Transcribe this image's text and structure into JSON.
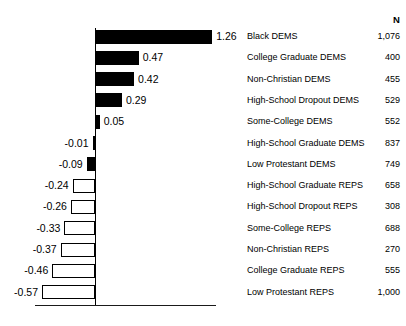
{
  "title_fragment": "",
  "columns": {
    "n_header": "N"
  },
  "axis": {
    "zero_value": 0,
    "unit_px": 93,
    "zero_x_px": 95
  },
  "chart_data": {
    "type": "bar",
    "orientation": "horizontal",
    "title": "",
    "subtitle": "",
    "xlabel": "",
    "ylabel": "",
    "grid": false,
    "legend": "none",
    "xlim": [
      -0.63,
      1.32
    ],
    "zero_line": true,
    "categories": [
      "Black DEMS",
      "College Graduate DEMS",
      "Non-Christian DEMS",
      "High-School Dropout DEMS",
      "Some-College DEMS",
      "High-School Graduate DEMS",
      "Low Protestant DEMS",
      "High-School Graduate REPS",
      "High-School Dropout REPS",
      "Some-College REPS",
      "Non-Christian REPS",
      "College Graduate REPS",
      "Low Protestant REPS"
    ],
    "values": [
      1.26,
      0.47,
      0.42,
      0.29,
      0.05,
      -0.01,
      -0.09,
      -0.24,
      -0.26,
      -0.33,
      -0.37,
      -0.46,
      -0.57
    ],
    "value_labels": [
      "1.26",
      "0.47",
      "0.42",
      "0.29",
      "0.05",
      "-0.01",
      "-0.09",
      "-0.24",
      "-0.26",
      "-0.33",
      "-0.37",
      "-0.46",
      "-0.57"
    ],
    "bar_fill": [
      "filled",
      "filled",
      "filled",
      "filled",
      "filled",
      "hollow",
      "filled",
      "hollow",
      "hollow",
      "hollow",
      "hollow",
      "hollow",
      "hollow"
    ],
    "n_counts": [
      "1,076",
      "400",
      "455",
      "529",
      "552",
      "837",
      "749",
      "658",
      "308",
      "688",
      "270",
      "555",
      "1,000"
    ],
    "colors": {
      "filled": "#000000",
      "hollow": "#ffffff",
      "outline": "#000000",
      "text": "#000000",
      "background": "#ffffff"
    }
  },
  "rows": [
    {
      "label": "Black DEMS",
      "value_label": "1.26",
      "n": "1,076"
    },
    {
      "label": "College Graduate DEMS",
      "value_label": "0.47",
      "n": "400"
    },
    {
      "label": "Non-Christian DEMS",
      "value_label": "0.42",
      "n": "455"
    },
    {
      "label": "High-School Dropout DEMS",
      "value_label": "0.29",
      "n": "529"
    },
    {
      "label": "Some-College DEMS",
      "value_label": "0.05",
      "n": "552"
    },
    {
      "label": "High-School Graduate DEMS",
      "value_label": "-0.01",
      "n": "837"
    },
    {
      "label": "Low Protestant DEMS",
      "value_label": "-0.09",
      "n": "749"
    },
    {
      "label": "High-School Graduate REPS",
      "value_label": "-0.24",
      "n": "658"
    },
    {
      "label": "High-School Dropout REPS",
      "value_label": "-0.26",
      "n": "308"
    },
    {
      "label": "Some-College REPS",
      "value_label": "-0.33",
      "n": "688"
    },
    {
      "label": "Non-Christian REPS",
      "value_label": "-0.37",
      "n": "270"
    },
    {
      "label": "College Graduate REPS",
      "value_label": "-0.46",
      "n": "555"
    },
    {
      "label": "Low Protestant REPS",
      "value_label": "-0.57",
      "n": "1,000"
    }
  ]
}
